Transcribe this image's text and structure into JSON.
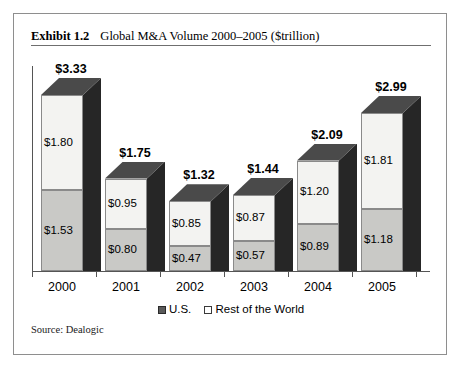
{
  "exhibit": {
    "label": "Exhibit 1.2",
    "title": "Global M&A Volume 2000–2005 ($trillion)",
    "source": "Source: Dealogic"
  },
  "legend": {
    "items": [
      {
        "label": "U.S.",
        "swatch": "filled-dark-square"
      },
      {
        "label": "Rest of the World",
        "swatch": "outlined-white-square"
      }
    ]
  },
  "chart_data": {
    "type": "bar",
    "subtype": "stacked-3d-column",
    "title": "Global M&A Volume 2000–2005 ($trillion)",
    "xlabel": "",
    "ylabel": "",
    "unit": "$trillion",
    "grid": false,
    "legend_position": "bottom",
    "ylim": [
      0,
      3.33
    ],
    "categories": [
      "2000",
      "2001",
      "2002",
      "2003",
      "2004",
      "2005"
    ],
    "series": [
      {
        "name": "U.S.",
        "values": [
          1.53,
          0.8,
          0.47,
          0.57,
          0.89,
          1.18
        ]
      },
      {
        "name": "Rest of the World",
        "values": [
          1.8,
          0.95,
          0.85,
          0.87,
          1.2,
          1.81
        ]
      }
    ],
    "totals": [
      3.33,
      1.75,
      1.32,
      1.44,
      2.09,
      2.99
    ],
    "value_labels": {
      "us": [
        "$1.53",
        "$0.80",
        "$0.47",
        "$0.57",
        "$0.89",
        "$1.18"
      ],
      "rest_of_world": [
        "$1.80",
        "$0.95",
        "$0.85",
        "$0.87",
        "$1.20",
        "$1.81"
      ],
      "totals": [
        "$3.33",
        "$1.75",
        "$1.32",
        "$1.44",
        "$2.09",
        "$2.99"
      ]
    },
    "colors": {
      "us_segment": "#c9c9c6",
      "rest_of_world_segment": "#f3f3f1",
      "bar_top_face": "#4a4a4a",
      "bar_side_face": "#262626",
      "axis": "#555555",
      "frame": "#8e8e8e"
    }
  }
}
